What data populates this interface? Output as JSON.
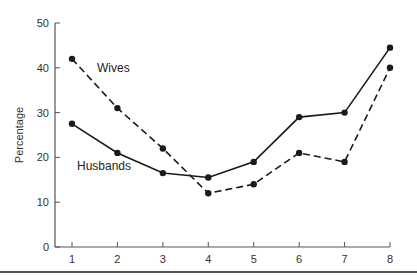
{
  "chart_data": {
    "type": "line",
    "title": "",
    "xlabel": "",
    "ylabel": "Percentage",
    "x": [
      1,
      2,
      3,
      4,
      5,
      6,
      7,
      8
    ],
    "xticks": [
      "1",
      "2",
      "3",
      "4",
      "5",
      "6",
      "7",
      "8"
    ],
    "yticks": [
      "0",
      "10",
      "20",
      "30",
      "40",
      "50"
    ],
    "ylim": [
      0,
      50
    ],
    "grid": false,
    "legend": "inline labels",
    "series": [
      {
        "name": "Wives",
        "style": "dashed",
        "values": [
          42,
          31,
          22,
          12,
          14,
          21,
          19,
          40
        ]
      },
      {
        "name": "Husbands",
        "style": "solid",
        "values": [
          27.5,
          21,
          16.5,
          15.5,
          19,
          29,
          30,
          44.5
        ]
      }
    ],
    "annotations": [
      {
        "text": "Wives",
        "near_x": 2
      },
      {
        "text": "Husbands",
        "near_x": 2
      }
    ],
    "colors": {
      "line": "#1a1a1a",
      "axis": "#555555"
    }
  }
}
